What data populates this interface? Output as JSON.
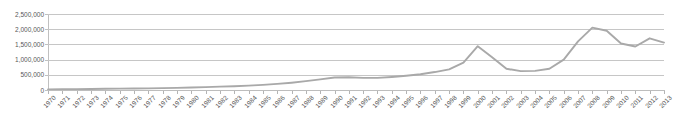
{
  "chart_data": {
    "type": "line",
    "title": "",
    "xlabel": "",
    "ylabel": "",
    "ylim": [
      0,
      2500000
    ],
    "grid": true,
    "legend": "none",
    "y_ticks": [
      "0",
      "500,000",
      "1,000,000",
      "1,500,000",
      "2,000,000",
      "2,500,000"
    ],
    "y_tick_values": [
      0,
      500000,
      1000000,
      1500000,
      2000000,
      2500000
    ],
    "categories": [
      "1970",
      "1971",
      "1972",
      "1973",
      "1974",
      "1975",
      "1976",
      "1977",
      "1978",
      "1979",
      "1980",
      "1981",
      "1982",
      "1983",
      "1984",
      "1985",
      "1986",
      "1987",
      "1988",
      "1989",
      "1990",
      "1991",
      "1992",
      "1993",
      "1994",
      "1995",
      "1996",
      "1997",
      "1998",
      "1999",
      "2000",
      "2001",
      "2002",
      "2003",
      "2004",
      "2005",
      "2006",
      "2007",
      "2008",
      "2009",
      "2010",
      "2011",
      "2012",
      "2013"
    ],
    "series": [
      {
        "name": "series-1",
        "color": "#a9a9a9",
        "values": [
          20000,
          25000,
          30000,
          35000,
          40000,
          45000,
          50000,
          55000,
          62000,
          70000,
          80000,
          95000,
          110000,
          125000,
          145000,
          170000,
          200000,
          240000,
          290000,
          350000,
          410000,
          420000,
          400000,
          400000,
          430000,
          470000,
          520000,
          590000,
          680000,
          900000,
          1440000,
          1080000,
          700000,
          620000,
          630000,
          700000,
          1000000,
          1600000,
          2050000,
          1950000,
          1530000,
          1430000,
          1700000,
          1560000
        ]
      }
    ]
  },
  "annotations": {
    "clipped_top_text": ""
  }
}
